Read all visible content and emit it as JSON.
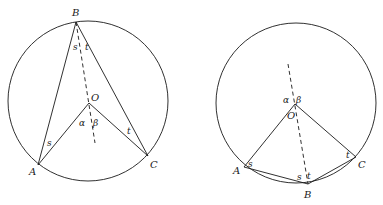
{
  "figures": [
    {
      "id": "left",
      "description": "Center O inside angle ABC",
      "labels": {
        "B": "B",
        "O": "O",
        "A": "A",
        "C": "C",
        "s_top": "s",
        "t_top": "t",
        "alpha": "α",
        "beta": "β",
        "s_bottom": "s",
        "t_bottom": "t"
      }
    },
    {
      "id": "right",
      "description": "Center O outside angle ABC (B on minor arc)",
      "labels": {
        "B": "B",
        "O": "O",
        "A": "A",
        "C": "C",
        "s_bottom": "s",
        "t_bottom": "t",
        "alpha": "α",
        "beta": "β",
        "s_A": "s",
        "t_C": "t"
      }
    }
  ],
  "colors": {
    "stroke": "#1a1a1a",
    "background": "#ffffff"
  }
}
